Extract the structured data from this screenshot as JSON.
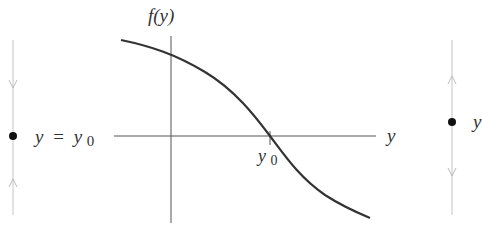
{
  "diagram": {
    "type": "phase-line-with-graph",
    "left_phase_line": {
      "equilibrium_label_var": "y",
      "equilibrium_label_eq": "=",
      "equilibrium_label_rhs": "y",
      "equilibrium_label_sub": "0",
      "arrow_above": "down",
      "arrow_below": "up",
      "stability": "sink"
    },
    "graph": {
      "y_axis_label": "f(y)",
      "x_axis_label": "y",
      "tick_label_var": "y",
      "tick_label_sub": "0",
      "curve": "decreasing sigmoid crossing zero at y0"
    },
    "right_phase_line": {
      "equilibrium_label_var": "y",
      "arrow_above": "up",
      "arrow_below": "down",
      "stability": "source"
    },
    "colors": {
      "axis": "#555555",
      "phase_line": "#bbbbbb",
      "curve": "#333333",
      "dot": "#111111"
    }
  }
}
